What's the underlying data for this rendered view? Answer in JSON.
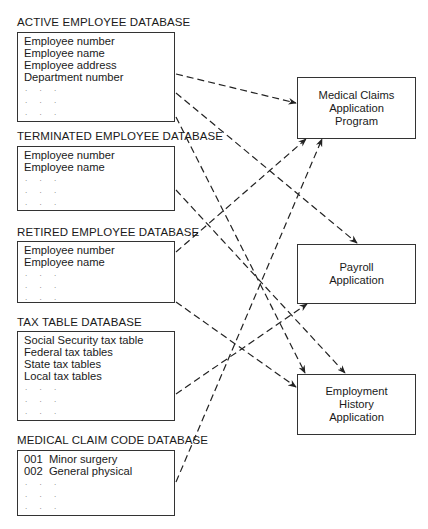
{
  "databases": [
    {
      "title": "ACTIVE EMPLOYEE DATABASE",
      "fields": [
        "Employee number",
        "Employee name",
        "Employee address",
        "Department number"
      ],
      "dots": [
        ". . .",
        ". . .",
        ". . ."
      ]
    },
    {
      "title": "TERMINATED EMPLOYEE DATABASE",
      "fields": [
        "Employee number",
        "Employee name"
      ],
      "dots": [
        ". . .",
        ". . .",
        ". . ."
      ]
    },
    {
      "title": "RETIRED EMPLOYEE DATABASE",
      "fields": [
        "Employee number",
        "Employee name"
      ],
      "dots": [
        ". . .",
        ". . .",
        ". . ."
      ]
    },
    {
      "title": "TAX TABLE DATABASE",
      "fields": [
        "Social Security tax table",
        "Federal tax tables",
        "State tax tables",
        "Local tax tables"
      ],
      "dots": [
        ". . .",
        ". . .",
        ". . ."
      ]
    },
    {
      "title": "MEDICAL CLAIM CODE DATABASE",
      "fields": [
        "001  Minor surgery",
        "002  General physical"
      ],
      "dots": [
        ". . .",
        ". . .",
        ". . ."
      ]
    }
  ],
  "applications": [
    {
      "lines": [
        "Medical Claims",
        "Application",
        "Program"
      ]
    },
    {
      "lines": [
        "Payroll",
        "Application"
      ]
    },
    {
      "lines": [
        "Employment",
        "History",
        "Application"
      ]
    }
  ],
  "connections": [
    {
      "from": "ACTIVE EMPLOYEE DATABASE",
      "to": "Medical Claims Application Program"
    },
    {
      "from": "ACTIVE EMPLOYEE DATABASE",
      "to": "Payroll Application"
    },
    {
      "from": "ACTIVE EMPLOYEE DATABASE",
      "to": "Employment History Application"
    },
    {
      "from": "TERMINATED EMPLOYEE DATABASE",
      "to": "Employment History Application"
    },
    {
      "from": "RETIRED EMPLOYEE DATABASE",
      "to": "Medical Claims Application Program"
    },
    {
      "from": "RETIRED EMPLOYEE DATABASE",
      "to": "Employment History Application"
    },
    {
      "from": "TAX TABLE DATABASE",
      "to": "Payroll Application"
    },
    {
      "from": "MEDICAL CLAIM CODE DATABASE",
      "to": "Medical Claims Application Program"
    }
  ],
  "colors": {
    "line": "#222222",
    "border": "#333333",
    "dots": "#777777"
  }
}
